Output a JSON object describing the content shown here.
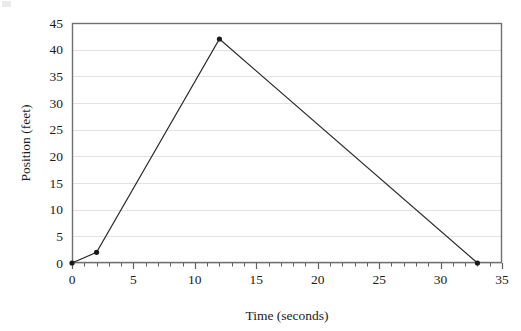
{
  "chart_data": {
    "type": "line",
    "title": "",
    "xlabel": "Time (seconds)",
    "ylabel": "Position (feet)",
    "xlim": [
      0,
      35
    ],
    "ylim": [
      0,
      45
    ],
    "x_major_step": 5,
    "x_minor_step": 1,
    "y_major_step": 5,
    "grid": "horizontal",
    "legend": "none",
    "x_tick_labels": [
      "0",
      "5",
      "10",
      "15",
      "20",
      "25",
      "30",
      "35"
    ],
    "y_tick_labels": [
      "0",
      "5",
      "10",
      "15",
      "20",
      "25",
      "30",
      "35",
      "40",
      "45"
    ],
    "x": [
      0,
      2,
      12,
      33
    ],
    "values": [
      0,
      2,
      42,
      0
    ],
    "series": [
      {
        "name": "Position",
        "x": [
          0,
          2,
          12,
          33
        ],
        "values": [
          0,
          2,
          42,
          0
        ],
        "line_color": "#2b2b2b",
        "marker": "circle",
        "marker_color": "#1a1a1a"
      }
    ],
    "colors": {
      "line": "#2b2b2b",
      "marker": "#1a1a1a",
      "grid": "#e2e2e2",
      "frame": "#707070",
      "axis": "#606060",
      "text": "#1a1a1a",
      "background": "#ffffff"
    }
  }
}
